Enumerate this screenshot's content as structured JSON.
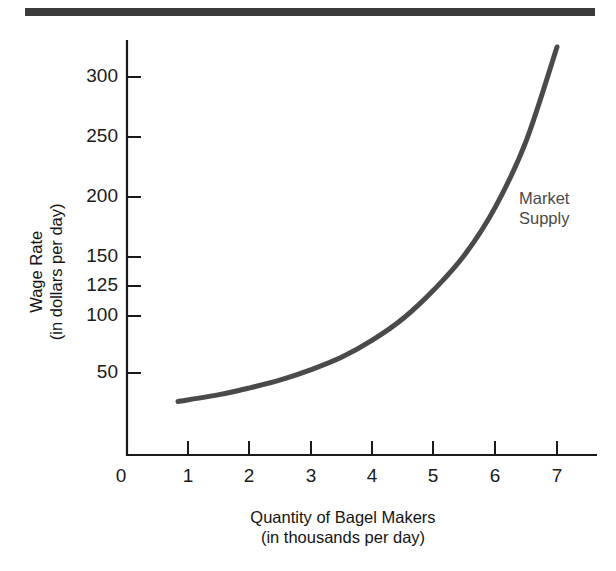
{
  "figure": {
    "top_rule_color": "#3b3b3b",
    "background_color": "#ffffff"
  },
  "chart_data": {
    "type": "line",
    "title": "",
    "subtitle": "",
    "xlabel": "Quantity of Bagel Makers",
    "xlabel_sub": "(in thousands per day)",
    "ylabel": "Wage Rate",
    "ylabel_sub": "(in dollars per day)",
    "grid": false,
    "legend_position": "inside-upper-right",
    "line_color": "#4a4a4a",
    "line_width_px": 5,
    "xlim": [
      0,
      7.65
    ],
    "ylim": [
      0,
      340
    ],
    "x_ticks": [
      0,
      1,
      2,
      3,
      4,
      5,
      6,
      7
    ],
    "x_tick_labels": [
      "0",
      "1",
      "2",
      "3",
      "4",
      "5",
      "6",
      "7"
    ],
    "y_ticks": [
      50,
      100,
      125,
      150,
      200,
      250,
      300
    ],
    "y_tick_labels": [
      "50",
      "100",
      "125",
      "150",
      "200",
      "250",
      "300"
    ],
    "y_axis_note": "non-uniform tick spacing; 125 inserted between 100 and 150",
    "series": [
      {
        "name": "Market Supply",
        "annotation_lines": [
          "Market",
          "Supply"
        ],
        "x": [
          0.83,
          1.5,
          2.0,
          2.5,
          3.0,
          3.5,
          4.0,
          4.5,
          5.0,
          5.5,
          6.0,
          6.5,
          7.0
        ],
        "values": [
          25,
          31,
          37,
          44,
          53,
          64,
          79,
          98,
          122,
          152,
          192,
          247,
          325
        ]
      }
    ]
  },
  "axes": {
    "y_tick_pixel_map": [
      {
        "value": 50,
        "y": 373
      },
      {
        "value": 100,
        "y": 316
      },
      {
        "value": 125,
        "y": 286
      },
      {
        "value": 150,
        "y": 257
      },
      {
        "value": 200,
        "y": 197
      },
      {
        "value": 250,
        "y": 137
      },
      {
        "value": 300,
        "y": 77
      }
    ],
    "x_tick_pixel_map": [
      {
        "value": 0,
        "x": 127
      },
      {
        "value": 1,
        "x": 188
      },
      {
        "value": 2,
        "x": 249
      },
      {
        "value": 3,
        "x": 311
      },
      {
        "value": 4,
        "x": 372
      },
      {
        "value": 5,
        "x": 433
      },
      {
        "value": 6,
        "x": 495
      },
      {
        "value": 7,
        "x": 557
      }
    ]
  }
}
